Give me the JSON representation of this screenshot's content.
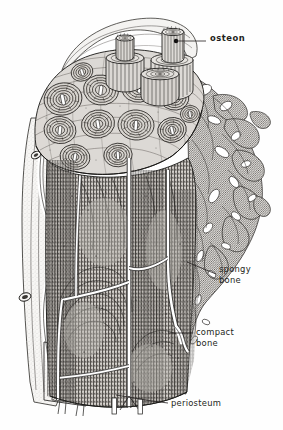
{
  "figure": {
    "style": "black-and-white engraved line drawing",
    "background_color": "#fefefe",
    "ink_color": "#231f20"
  },
  "labels": [
    {
      "id": "osteon",
      "text": "osteon",
      "weight": "bold",
      "lines": [
        "osteon"
      ],
      "leader": {
        "from_x": 176,
        "from_y": 41,
        "to_x": 206,
        "to_y": 41,
        "dot": true
      }
    },
    {
      "id": "spongy_bone",
      "text": "spongy bone",
      "weight": "regular",
      "lines": [
        "spongy",
        "bone"
      ],
      "leader": {
        "from_x": 187,
        "from_y": 262,
        "to_x": 216,
        "to_y": 274,
        "dot": true
      }
    },
    {
      "id": "compact_bone",
      "text": "compact bone",
      "weight": "regular",
      "lines": [
        "compact",
        "bone"
      ],
      "leader": {
        "from_x": 168,
        "from_y": 333,
        "to_x": 193,
        "to_y": 333,
        "dot": false
      }
    },
    {
      "id": "periosteum",
      "text": "periosteum",
      "weight": "regular",
      "lines": [
        "periosteum"
      ],
      "leader": {
        "from_x": 116,
        "from_y": 395,
        "to_x": 168,
        "to_y": 403,
        "dot": false
      }
    }
  ],
  "structures": [
    {
      "name": "osteon-cylinder-tall",
      "description": "protruding cylindrical osteon at top right"
    },
    {
      "name": "osteon-cylinder-mid",
      "description": "protruding cylindrical osteon at top center"
    },
    {
      "name": "osteon-cylinder-short",
      "description": "protruding cylindrical osteon at top center-right"
    },
    {
      "name": "cut-surface",
      "description": "transverse cut face showing concentric lamellae of many osteons"
    },
    {
      "name": "spongy-bone-trabeculae",
      "description": "branching porous trabecular network on the right"
    },
    {
      "name": "compact-bone-shaft",
      "description": "longitudinal cut showing dense compact bone with canals"
    },
    {
      "name": "periosteum-layer",
      "description": "outer fibrous membrane peeled back at left"
    },
    {
      "name": "blood-vessel",
      "description": "vessel running through periosteum and into bone canals"
    }
  ],
  "osteon_canal_count": 13
}
